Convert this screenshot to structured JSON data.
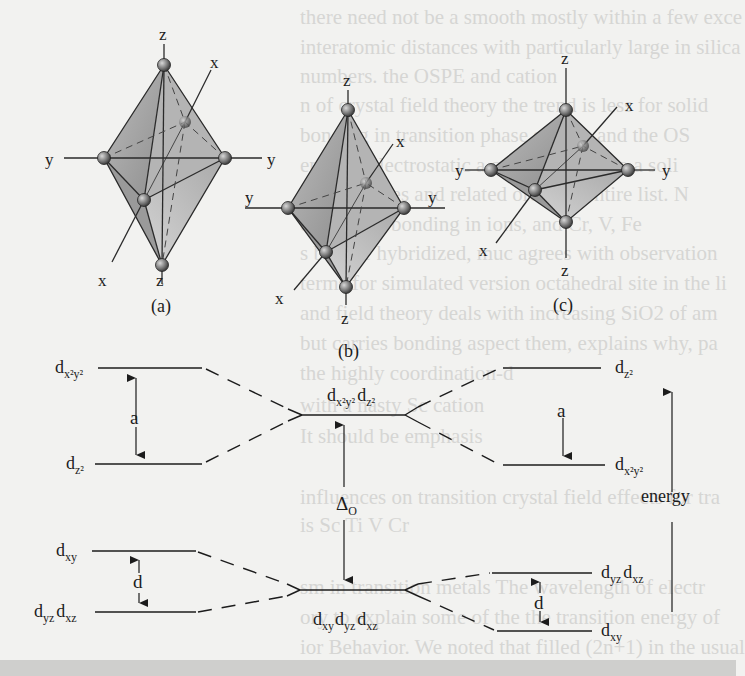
{
  "figure": {
    "panels": [
      {
        "id": "a",
        "label": "(a)",
        "description": "octahedron elongated along z"
      },
      {
        "id": "b",
        "label": "(b)",
        "description": "regular octahedron"
      },
      {
        "id": "c",
        "label": "(c)",
        "description": "octahedron compressed along z"
      }
    ],
    "axis_labels": {
      "x": "x",
      "y": "y",
      "z": "z"
    },
    "energy_diagram": {
      "elongated": {
        "levels": [
          {
            "name": "d",
            "sub": "x²y²"
          },
          {
            "name": "d",
            "sub": "z²"
          },
          {
            "name": "d",
            "sub": "xy"
          },
          {
            "name": "d",
            "sub": "yz",
            "name2": "d",
            "sub2": "xz"
          }
        ],
        "upper_gap": "a",
        "lower_gap": "d"
      },
      "octahedral": {
        "eg": {
          "name": "d",
          "sub": "x²y²",
          "name2": "d",
          "sub2": "z²"
        },
        "t2g": {
          "name": "d",
          "sub": "xy",
          "name2": "d",
          "sub2": "yz",
          "name3": "d",
          "sub3": "xz"
        },
        "gap": "Δ",
        "gap_sub": "O"
      },
      "compressed": {
        "levels": [
          {
            "name": "d",
            "sub": "z²"
          },
          {
            "name": "d",
            "sub": "x²y²"
          },
          {
            "name": "d",
            "sub": "yz",
            "name2": "d",
            "sub2": "xz"
          },
          {
            "name": "d",
            "sub": "xy"
          }
        ],
        "upper_gap": "a",
        "lower_gap": "d"
      },
      "energy_axis_label": "energy"
    }
  },
  "bleed_through_text": [
    "there need not be a smooth   mostly within a few exce",
    "interatomic distances with   particularly large in silica",
    "numbers.                      the OSPE and cation",
    "n of crystal field theory    the trend is less for solid",
    "bonding in transition       phase system and the OS",
    "entirely electrostatic      a crystal field into a soli",
    "d. In sulfides and related   order of entire list. N",
    "e covalent bonding in        ions, and Cr, V, Fe",
    "s but are hybridized, muc    agrees with observation",
    "terms for simulated version  octahedral site in the li",
    "and field theory deals with  increasing SiO2 of am",
    "but carries bonding aspect   them, explains why, pa",
    "                             the highly coordination-d",
    "                             with a nasty Sc cation",
    "                             It should be emphasis",
    "influences on transition     crystal field effects for tra",
    "                             is Sc    Ti   V   Cr",
    "sm in transition metals      The wavelength of electr",
    "ory to explain some of the   the transition energy of",
    "ior Behavior. We noted that  filled (2n+1) in the usual"
  ]
}
